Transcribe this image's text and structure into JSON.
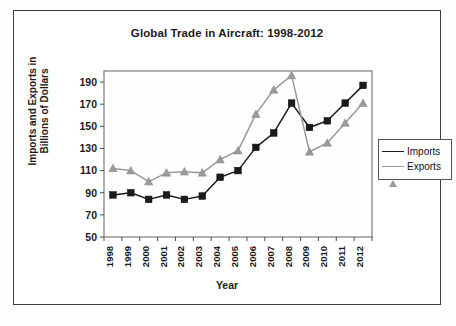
{
  "figure": {
    "title": "Global Trade in Aircraft: 1998-2012",
    "x_axis_title": "Year",
    "y_axis_title_line1": "Imports and Exports in",
    "y_axis_title_line2": "Billions of Dollars",
    "border_color": "#3d3d3d",
    "plot_background": "#ffffff"
  },
  "legend": {
    "position": "right",
    "items": [
      {
        "label": "Imports",
        "color": "#1b1b1b",
        "marker": "square"
      },
      {
        "label": "Exports",
        "color": "#9a9a9a",
        "marker": "triangle"
      }
    ]
  },
  "chart_data": {
    "type": "line",
    "title": "Global Trade in Aircraft: 1998-2012",
    "xlabel": "Year",
    "ylabel": "Imports and Exports in Billions of Dollars",
    "categories": [
      "1998",
      "1999",
      "2000",
      "2001",
      "2002",
      "2003",
      "2004",
      "2005",
      "2006",
      "2007",
      "2008",
      "2009",
      "2010",
      "2011",
      "2012"
    ],
    "x": [
      1998,
      1999,
      2000,
      2001,
      2002,
      2003,
      2004,
      2005,
      2006,
      2007,
      2008,
      2009,
      2010,
      2011,
      2012
    ],
    "ylim": [
      50,
      200
    ],
    "yticks": [
      50,
      70,
      90,
      110,
      130,
      150,
      170,
      190
    ],
    "ytick_labels": [
      "50",
      "70",
      "90",
      "110",
      "130",
      "150",
      "170",
      "190"
    ],
    "grid": "horizontal",
    "legend_position": "right",
    "series": [
      {
        "name": "Imports",
        "color": "#1b1b1b",
        "marker": "square",
        "values": [
          88,
          90,
          84,
          88,
          84,
          87,
          104,
          110,
          131,
          144,
          171,
          149,
          155,
          171,
          187
        ]
      },
      {
        "name": "Exports",
        "color": "#9a9a9a",
        "marker": "triangle",
        "values": [
          112,
          110,
          100,
          108,
          109,
          108,
          120,
          128,
          161,
          183,
          196,
          127,
          135,
          153,
          171
        ]
      }
    ]
  }
}
